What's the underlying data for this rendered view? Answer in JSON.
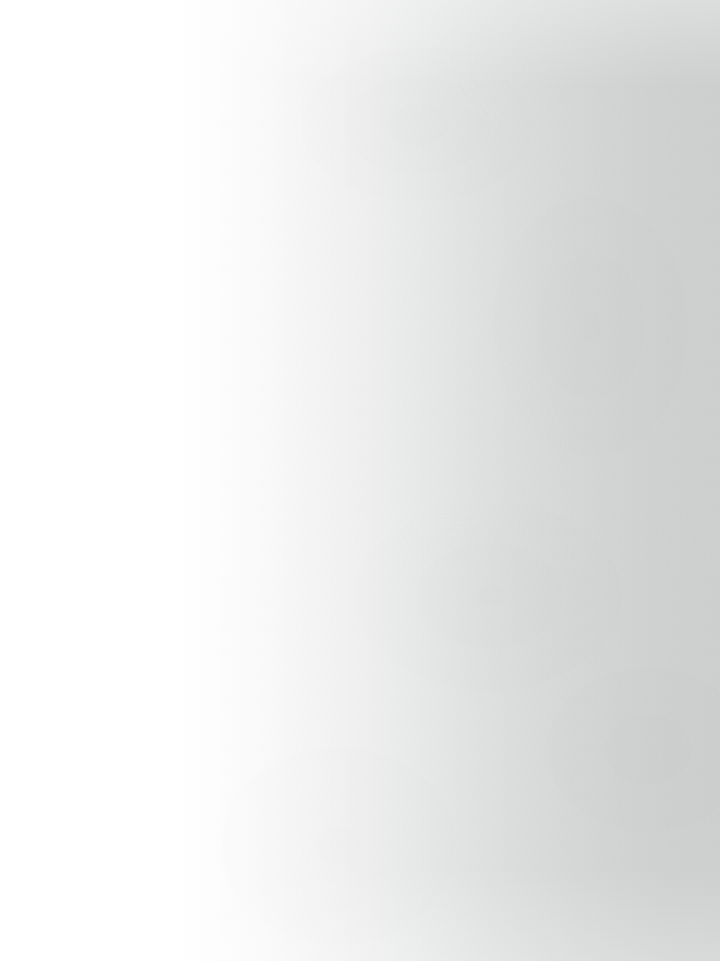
{
  "page": {
    "kind": "scanned-blank-page",
    "width": 720,
    "height": 961,
    "orientation": "portrait",
    "visible_text": "",
    "page_number": "",
    "heading": "",
    "body_text": "",
    "marginalia": "",
    "footer_text": ""
  },
  "appearance": {
    "background_left_color": "#ffffff",
    "background_mid_color": "#f0f0f1",
    "background_right_color": "#cfd0d0",
    "gradient_direction": "left-to-right",
    "gradient_white_extent_percent": 24,
    "texture": "paper-fiber",
    "texture_visible_side": "right"
  },
  "regions": {
    "left_margin_label": "",
    "right_margin_label": "",
    "top_edge_label": "",
    "bottom_edge_label": ""
  }
}
